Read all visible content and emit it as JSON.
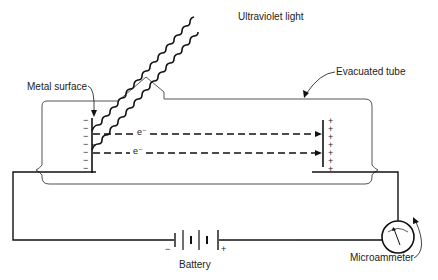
{
  "diagram": {
    "labels": {
      "uv_light": "Ultraviolet light",
      "metal_surface": "Metal surface",
      "evacuated_tube": "Evacuated tube",
      "battery": "Battery",
      "microammeter": "Microammeter"
    },
    "electron_labels": [
      "e⁻",
      "e⁻"
    ],
    "cathode_charges": [
      "−",
      "−",
      "−",
      "−",
      "−",
      "−",
      "−"
    ],
    "anode_charges": [
      "+",
      "+",
      "+",
      "+",
      "+",
      "+",
      "+"
    ],
    "battery_terminals": {
      "negative": "−",
      "positive": "+"
    },
    "colors": {
      "line": "#111111",
      "tube": "#555555",
      "background": "#ffffff"
    }
  }
}
